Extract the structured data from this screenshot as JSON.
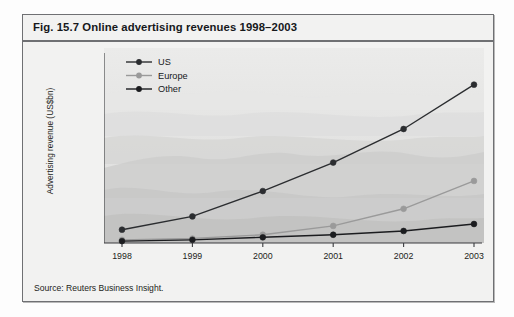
{
  "figure": {
    "title": "Fig. 15.7  Online advertising revenues 1998–2003",
    "source": "Source: Reuters Business Insight."
  },
  "colors": {
    "series_us": "#2b2d30",
    "series_europe": "#9a9a9a",
    "series_other": "#1b1c1f",
    "axis": "#3a3b3e",
    "panel_bg": "#f2f2f1",
    "frame": "#6f7073",
    "text": "#1c1d20"
  },
  "chart_data": {
    "type": "line",
    "title": "Online advertising revenues 1998–2003",
    "xlabel": "",
    "ylabel": "Advertising revenue (US$bn)",
    "categories": [
      "1998",
      "1999",
      "2000",
      "2001",
      "2002",
      "2003"
    ],
    "ylim": [
      0,
      30
    ],
    "yticks": [
      0,
      5,
      10,
      15,
      20,
      25,
      30
    ],
    "grid": false,
    "legend_position": "top-left",
    "series": [
      {
        "name": "US",
        "values": [
          2.1,
          4.2,
          8.2,
          12.7,
          18.0,
          25.0
        ]
      },
      {
        "name": "Europe",
        "values": [
          0.5,
          0.7,
          1.3,
          2.7,
          5.4,
          9.8
        ]
      },
      {
        "name": "Other",
        "values": [
          0.3,
          0.5,
          0.9,
          1.3,
          1.9,
          3.0
        ]
      }
    ]
  }
}
